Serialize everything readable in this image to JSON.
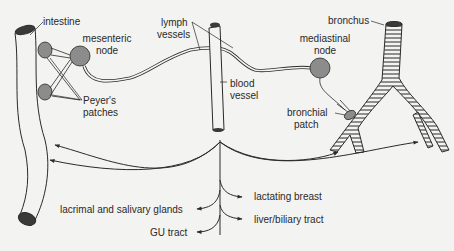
{
  "diagram": {
    "type": "anatomical schematic",
    "colors": {
      "background": "#f3f3f1",
      "line": "#2a2a2a",
      "node_fill": "#8c8c8c",
      "lumen_fill": "#3a3a3a"
    },
    "labels": {
      "intestine": "intestine",
      "mesenteric_node_1": "mesenteric",
      "mesenteric_node_2": "node",
      "peyers_1": "Peyer's",
      "peyers_2": "patches",
      "lymph_1": "lymph",
      "lymph_2": "vessels",
      "blood_1": "blood",
      "blood_2": "vessel",
      "mediastinal_1": "mediastinal",
      "mediastinal_2": "node",
      "bronchus": "bronchus",
      "bronchial_1": "bronchial",
      "bronchial_2": "patch",
      "lactating": "lactating breast",
      "lacrimal": "lacrimal and salivary glands",
      "liver": "liver/biliary tract",
      "gu": "GU tract"
    },
    "nodes": [
      "intestine",
      "Peyer's patches",
      "mesenteric node",
      "lymph vessels",
      "blood vessel",
      "mediastinal node",
      "bronchial patch",
      "bronchus"
    ],
    "edges": [
      {
        "from": "Peyer's patches",
        "to": "mesenteric node"
      },
      {
        "from": "mesenteric node",
        "to": "lymph vessels"
      },
      {
        "from": "bronchial patch",
        "to": "mediastinal node"
      },
      {
        "from": "mediastinal node",
        "to": "lymph vessels"
      },
      {
        "from": "lymph vessels",
        "to": "blood vessel"
      },
      {
        "from": "blood vessel",
        "to": "intestine"
      },
      {
        "from": "blood vessel",
        "to": "bronchus"
      },
      {
        "from": "blood vessel",
        "to": "lactating breast"
      },
      {
        "from": "blood vessel",
        "to": "lacrimal and salivary glands"
      },
      {
        "from": "blood vessel",
        "to": "liver/biliary tract"
      },
      {
        "from": "blood vessel",
        "to": "GU tract"
      }
    ]
  }
}
